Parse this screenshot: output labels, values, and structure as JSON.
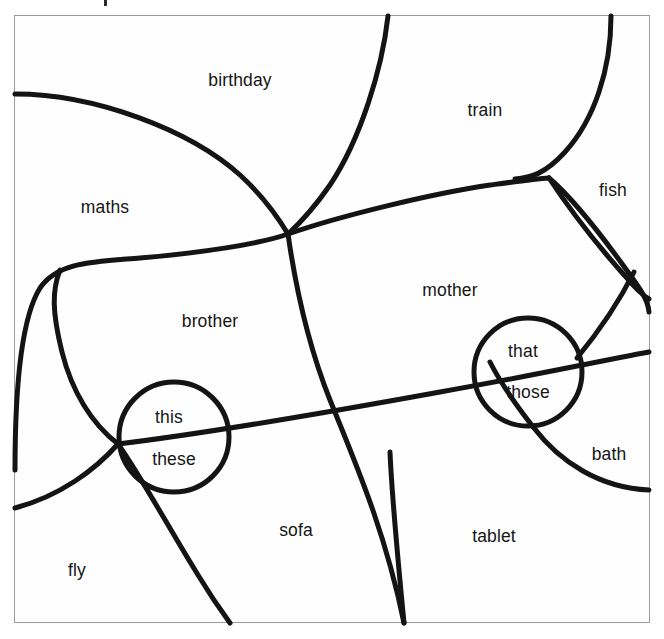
{
  "diagram": {
    "type": "word-sorting-venn-diagram",
    "frame": {
      "border_color": "#9a9a9a",
      "background_color": "#fefefe",
      "x": 14,
      "y": 15,
      "width": 636,
      "height": 608
    },
    "stroke_color": "#141414",
    "text_color": "#151515",
    "region_labels": [
      {
        "id": "maths",
        "text": "maths",
        "x": 105,
        "y": 207
      },
      {
        "id": "birthday",
        "text": "birthday",
        "x": 240,
        "y": 80
      },
      {
        "id": "train",
        "text": "train",
        "x": 485,
        "y": 110
      },
      {
        "id": "fish",
        "text": "fish",
        "x": 613,
        "y": 190
      },
      {
        "id": "brother",
        "text": "brother",
        "x": 210,
        "y": 321
      },
      {
        "id": "mother",
        "text": "mother",
        "x": 450,
        "y": 290
      },
      {
        "id": "bath",
        "text": "bath",
        "x": 609,
        "y": 454
      },
      {
        "id": "sofa",
        "text": "sofa",
        "x": 296,
        "y": 530
      },
      {
        "id": "tablet",
        "text": "tablet",
        "x": 494,
        "y": 536
      },
      {
        "id": "fly",
        "text": "fly",
        "x": 77,
        "y": 570
      }
    ],
    "circles": [
      {
        "id": "left-circle",
        "cx": 174,
        "cy": 437,
        "r": 55,
        "labels": [
          {
            "id": "this",
            "text": "this",
            "x": 169,
            "y": 417
          },
          {
            "id": "these",
            "text": "these",
            "x": 174,
            "y": 459
          }
        ]
      },
      {
        "id": "right-circle",
        "cx": 528,
        "cy": 372,
        "r": 54,
        "labels": [
          {
            "id": "that",
            "text": "that",
            "x": 523,
            "y": 351
          },
          {
            "id": "those",
            "text": "those",
            "x": 528,
            "y": 392
          }
        ]
      }
    ],
    "curves": [
      {
        "id": "curve-maths-birthday"
      },
      {
        "id": "curve-birthday-train"
      },
      {
        "id": "curve-train-fish"
      },
      {
        "id": "curve-fish-mother"
      },
      {
        "id": "curve-long-horizontal-upper"
      },
      {
        "id": "curve-long-horizontal-lower"
      },
      {
        "id": "curve-brother-sofa"
      },
      {
        "id": "curve-fly-sofa"
      },
      {
        "id": "curve-bath-tablet"
      },
      {
        "id": "curve-mother-tablet"
      }
    ]
  }
}
